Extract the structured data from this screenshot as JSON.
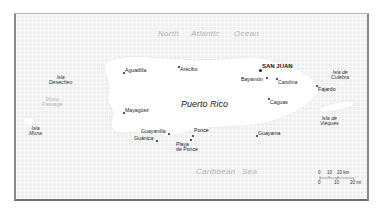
{
  "map": {
    "country_label": "Puerto Rico",
    "capital": {
      "name": "SAN JUAN"
    },
    "cities": [
      {
        "name": "Aguadilla"
      },
      {
        "name": "Arecibo"
      },
      {
        "name": "Bayamón"
      },
      {
        "name": "Carolina"
      },
      {
        "name": "Fajardo"
      },
      {
        "name": "Mayagüez"
      },
      {
        "name": "Caguas"
      },
      {
        "name": "Guayanilla"
      },
      {
        "name": "Guánica"
      },
      {
        "name": "Ponce"
      },
      {
        "name": "Playa de Ponce",
        "line1": "Playa",
        "line2": "de Ponce"
      },
      {
        "name": "Guayama"
      }
    ],
    "islands": [
      {
        "name": "Isla Desecheo",
        "line1": "Isla",
        "line2": "Desecheo"
      },
      {
        "name": "Isla Mona",
        "line1": "Isla",
        "line2": "Mona"
      },
      {
        "name": "Isla de Culebra",
        "line1": "Isla de",
        "line2": "Culebra"
      },
      {
        "name": "Isla de Vieques",
        "line1": "Isla de",
        "line2": "Vieques"
      }
    ],
    "water_bodies": [
      {
        "name": "North Atlantic Ocean",
        "words": [
          "North",
          "Atlantic",
          "Ocean"
        ]
      },
      {
        "name": "Caribbean Sea",
        "words": [
          "Caribbean",
          "Sea"
        ]
      },
      {
        "name": "Mona Passage",
        "line1": "Mona",
        "line2": "Passage"
      }
    ],
    "scale_bar": {
      "km_ticks": [
        "0",
        "10",
        "20 km"
      ],
      "mi_ticks": [
        "0",
        "10",
        "20 mi"
      ]
    },
    "colors": {
      "sea": "#efefef",
      "land": "#ffffff",
      "frame": "#8a8a8a",
      "label": "#222222",
      "water_label": "#b5b5b5"
    }
  }
}
